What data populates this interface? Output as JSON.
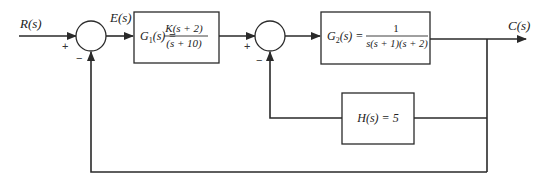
{
  "diagram": {
    "type": "block-diagram",
    "signals": {
      "input": "R(s)",
      "error": "E(s)",
      "output": "C(s)"
    },
    "blocks": [
      {
        "id": "G1",
        "name_lhs": "G",
        "sub": "1",
        "arg": "(s) =",
        "numerator": "K(s + 2)",
        "denominator": "(s + 10)"
      },
      {
        "id": "G2",
        "name_lhs": "G",
        "sub": "2",
        "arg": "(s) =",
        "numerator": "1",
        "denominator": "s(s + 1)(s + 2)"
      },
      {
        "id": "H",
        "label": "H(s) = 5"
      }
    ],
    "summing_junctions": [
      {
        "id": "S1",
        "plus": "+",
        "minus": "−"
      },
      {
        "id": "S2",
        "plus": "+",
        "minus": "−"
      }
    ],
    "connections": [
      "R(s) → S1(+)",
      "S1 → E(s) → G1",
      "G1 → S2(+)",
      "S2 → G2",
      "G2 → C(s)",
      "C(s) → H → S2(−)",
      "C(s) → S1(−) (unity feedback)"
    ],
    "colors": {
      "stroke": "#2a2a2a",
      "background": "#ffffff"
    }
  }
}
